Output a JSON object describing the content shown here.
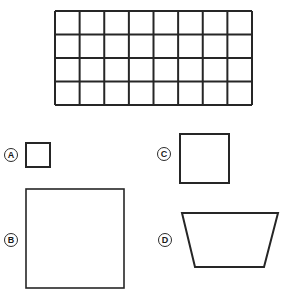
{
  "figure": {
    "background_color": "#ffffff",
    "stroke_color": "#262626",
    "fill_color": "#ffffff",
    "width": 296,
    "height": 293
  },
  "grid": {
    "name": "reference-grid",
    "columns": 8,
    "rows": 4,
    "total_cells": 32,
    "x": 55,
    "y": 11,
    "width": 197,
    "height": 94,
    "cell_width": 24.6,
    "cell_height": 23.5,
    "line_width": 2,
    "line_color": "#262626"
  },
  "shapes": [
    {
      "id": "A",
      "label": "A",
      "type": "square",
      "label_x": 4,
      "label_y": 148,
      "x": 26,
      "y": 143,
      "width": 24,
      "height": 24,
      "stroke_width": 2
    },
    {
      "id": "B",
      "label": "B",
      "type": "square",
      "label_x": 4,
      "label_y": 233,
      "x": 26,
      "y": 189,
      "width": 98,
      "height": 99,
      "stroke_width": 1.6
    },
    {
      "id": "C",
      "label": "C",
      "type": "square",
      "label_x": 157,
      "label_y": 147,
      "x": 180,
      "y": 134,
      "width": 49,
      "height": 49,
      "stroke_width": 2
    },
    {
      "id": "D",
      "label": "D",
      "type": "trapezoid",
      "label_x": 158,
      "label_y": 233,
      "points": "182,213 278,213 264,267 195,267",
      "stroke_width": 2
    }
  ]
}
